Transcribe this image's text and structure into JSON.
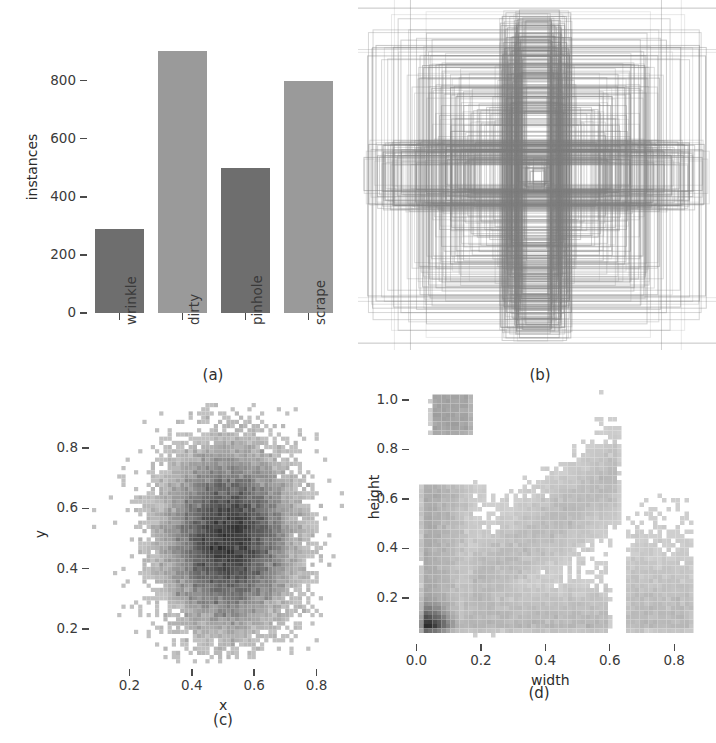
{
  "figure": {
    "panel_count": 4,
    "background": "#ffffff",
    "captions": [
      "(a)",
      "(b)",
      "(c)",
      "(d)"
    ]
  },
  "chart_data": [
    {
      "panel": "(a)",
      "type": "bar",
      "title": "",
      "xlabel": "",
      "ylabel": "instances",
      "categories": [
        "wrinkle",
        "dirty",
        "pinhole",
        "scrape"
      ],
      "values": [
        290,
        901,
        500,
        800
      ],
      "bar_colors": [
        "#6e6e6e",
        "#9a9a9a",
        "#6e6e6e",
        "#9a9a9a"
      ],
      "yticks": [
        0,
        200,
        400,
        600,
        800
      ],
      "ytick_labels": [
        "0",
        "200",
        "400",
        "600",
        "800"
      ],
      "ylim": [
        0,
        940
      ],
      "grid": false,
      "legend": "none"
    },
    {
      "panel": "(b)",
      "type": "scatter",
      "title": "",
      "xlabel": "",
      "ylabel": "",
      "description": "overlay of anchor bounding boxes centred on the image",
      "axes_visible": false,
      "box_color": "#8c8c8c",
      "box_count": 420,
      "grid": false,
      "legend": "none"
    },
    {
      "panel": "(c)",
      "type": "heatmap",
      "title": "",
      "xlabel": "x",
      "ylabel": "y",
      "xticks": [
        0.2,
        0.4,
        0.6,
        0.8
      ],
      "xtick_labels": [
        "0.2",
        "0.4",
        "0.6",
        "0.8"
      ],
      "yticks": [
        0.2,
        0.4,
        0.6,
        0.8
      ],
      "ytick_labels": [
        "0.2",
        "0.4",
        "0.6",
        "0.8"
      ],
      "xlim": [
        0.08,
        0.92
      ],
      "ylim": [
        0.08,
        0.95
      ],
      "colormap": "greys",
      "peak_center": [
        0.52,
        0.5
      ],
      "grid": false,
      "legend": "none"
    },
    {
      "panel": "(d)",
      "type": "heatmap",
      "title": "",
      "xlabel": "width",
      "ylabel": "height",
      "xticks": [
        0.0,
        0.2,
        0.4,
        0.6,
        0.8
      ],
      "xtick_labels": [
        "0.0",
        "0.2",
        "0.4",
        "0.6",
        "0.8"
      ],
      "yticks": [
        0.2,
        0.4,
        0.6,
        0.8,
        1.0
      ],
      "ytick_labels": [
        "0.2",
        "0.4",
        "0.6",
        "0.8",
        "1.0"
      ],
      "xlim": [
        -0.02,
        0.88
      ],
      "ylim": [
        0.03,
        1.04
      ],
      "colormap": "greys",
      "peak_center": [
        0.05,
        0.08
      ],
      "grid": false,
      "legend": "none"
    }
  ]
}
